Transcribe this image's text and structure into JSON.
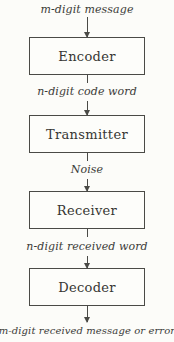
{
  "diagram": {
    "type": "vertical-flow",
    "colors": {
      "background": "#fcfcf9",
      "line": "#4a4a46",
      "text": "#3b3b38"
    },
    "flow": [
      {
        "type": "label",
        "text": "m-digit message"
      },
      {
        "type": "box",
        "text": "Encoder"
      },
      {
        "type": "label",
        "text": "n-digit code word"
      },
      {
        "type": "box",
        "text": "Transmitter"
      },
      {
        "type": "label",
        "text": "Noise"
      },
      {
        "type": "box",
        "text": "Receiver"
      },
      {
        "type": "label",
        "text": "n-digit received word"
      },
      {
        "type": "box",
        "text": "Decoder"
      },
      {
        "type": "label",
        "text": "m-digit received message or error"
      }
    ]
  }
}
